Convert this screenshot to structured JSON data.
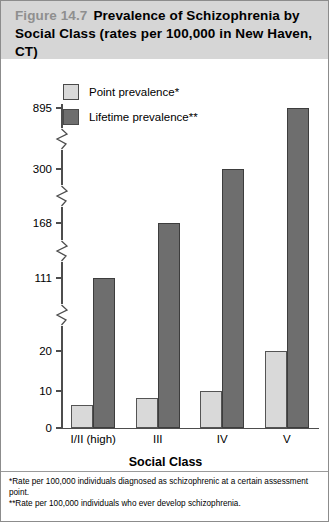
{
  "figure": {
    "number_label": "Figure 14.7",
    "title": "Prevalence of Schizophrenia by Social Class (rates per 100,000 in New Haven, CT)"
  },
  "legend": {
    "items": [
      {
        "label": "Point prevalence*",
        "swatch": "light-gray-swatch",
        "color": "#d9d9d9"
      },
      {
        "label": "Lifetime prevalence**",
        "swatch": "dark-gray-swatch",
        "color": "#6e6e6e"
      }
    ]
  },
  "footnotes": [
    "*Rate per 100,000 individuals diagnosed as schizophrenic at a certain assessment point.",
    "**Rate per 100,000 individuals who ever develop schizophrenia."
  ],
  "chart_data": {
    "type": "bar",
    "title": "Prevalence of Schizophrenia by Social Class (rates per 100,000 in New Haven, CT)",
    "xlabel": "Social Class",
    "ylabel": "",
    "categories": [
      "I/II (high)",
      "III",
      "IV",
      "V"
    ],
    "series": [
      {
        "name": "Point prevalence*",
        "color": "#d9d9d9",
        "values": [
          6,
          8,
          10,
          20
        ]
      },
      {
        "name": "Lifetime prevalence**",
        "color": "#6e6e6e",
        "values": [
          111,
          168,
          300,
          895
        ]
      }
    ],
    "y_ticks": [
      0,
      10,
      20,
      111,
      168,
      300,
      895
    ],
    "y_tick_labels": [
      "0",
      "10",
      "20",
      "111",
      "168",
      "300",
      "895"
    ],
    "axis_breaks": true,
    "grid": false,
    "legend_position": "top-left-inside"
  }
}
